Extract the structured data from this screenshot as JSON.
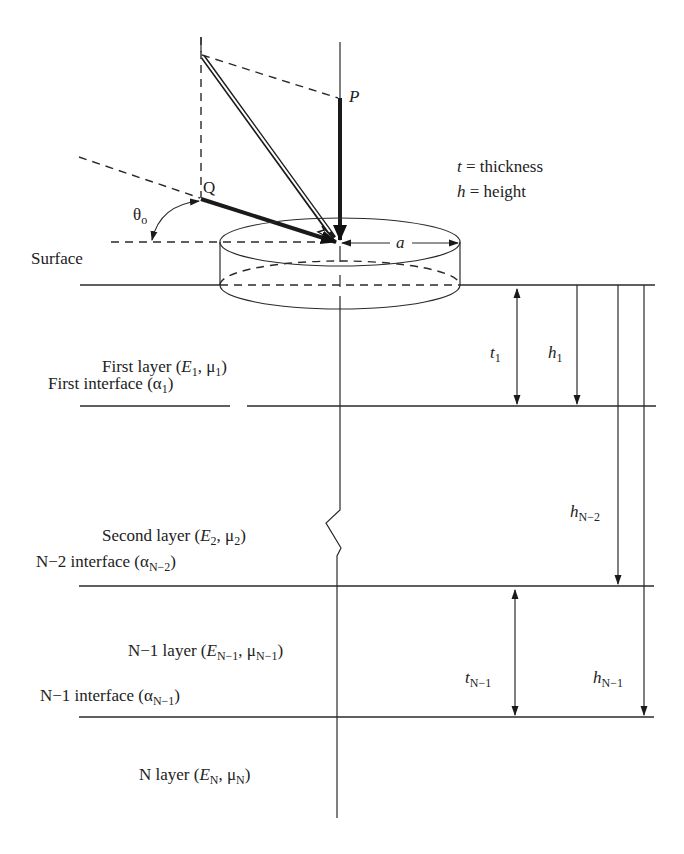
{
  "figure": {
    "type": "multilayer-elastic-system-schematic",
    "legend": {
      "thickness": {
        "symbol": "t",
        "text": " = thickness"
      },
      "height": {
        "symbol": "h",
        "text": " = height"
      }
    },
    "load": {
      "point_p": "P",
      "point_q": "Q",
      "angle": {
        "symbol": "θ",
        "sub": "o"
      },
      "radius": "a"
    },
    "surface_label": "Surface",
    "layers": [
      {
        "name": "First layer (",
        "E": "E",
        "E_sub": "1",
        "mu": "μ",
        "mu_sub": "1",
        "close": ")"
      },
      {
        "name": "Second layer (",
        "E": "E",
        "E_sub": "2",
        "mu": "μ",
        "mu_sub": "2",
        "close": ")"
      },
      {
        "name": "N−1 layer (",
        "E": "E",
        "E_sub": "N−1",
        "mu": "μ",
        "mu_sub": "N−1",
        "close": ")"
      },
      {
        "name": "N layer (",
        "E": "E",
        "E_sub": "N",
        "mu": "μ",
        "mu_sub": "N",
        "close": ")"
      }
    ],
    "interfaces": [
      {
        "name": "First interface (",
        "alpha": "α",
        "sub": "1",
        "close": ")"
      },
      {
        "name": "N−2 interface (",
        "alpha": "α",
        "sub": "N−2",
        "close": ")"
      },
      {
        "name": "N−1 interface (",
        "alpha": "α",
        "sub": "N−1",
        "close": ")"
      }
    ],
    "dimensions": {
      "t1": {
        "symbol": "t",
        "sub": "1"
      },
      "h1": {
        "symbol": "h",
        "sub": "1"
      },
      "hN2": {
        "symbol": "h",
        "sub": "N−2"
      },
      "tN1": {
        "symbol": "t",
        "sub": "N−1"
      },
      "hN1": {
        "symbol": "h",
        "sub": "N−1"
      }
    },
    "colors": {
      "ink": "#222222",
      "background": "#ffffff"
    }
  }
}
